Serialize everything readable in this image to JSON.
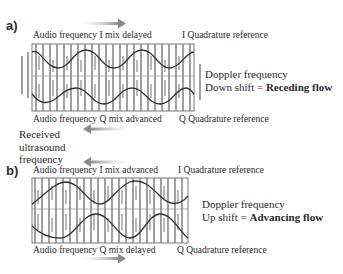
{
  "panel_a": {
    "label": "a)",
    "top_caption": "Audio frequency I mix delayed",
    "top_reference": "I Quadrature reference",
    "bottom_caption": "Audio frequency Q mix advanced",
    "bottom_reference": "Q Quadrature reference",
    "doppler_line1": "Doppler frequency",
    "doppler_line2_prefix": "Down shift = ",
    "doppler_line2_bold": "Receding flow",
    "arrow_direction": "right"
  },
  "received": {
    "line1": "Received",
    "line2": "ultrasound",
    "line3": "frequency",
    "arrow_direction": "left"
  },
  "panel_b": {
    "label": "b)",
    "top_caption": "Audio frequency I mix advanced",
    "top_reference": "I Quadrature reference",
    "bottom_caption": "Audio frequency Q mix delayed",
    "bottom_reference": "Q Quadrature reference",
    "doppler_line1": "Doppler frequency",
    "doppler_line2_prefix": "Up shift = ",
    "doppler_line2_bold": "Advancing flow",
    "arrow_direction": "right"
  },
  "colors": {
    "waveform": "#3a3a3a",
    "bars": "#8a8a8a",
    "frame": "#555555",
    "arrow": "#9a9a9a",
    "label": "#1e2d4a"
  }
}
